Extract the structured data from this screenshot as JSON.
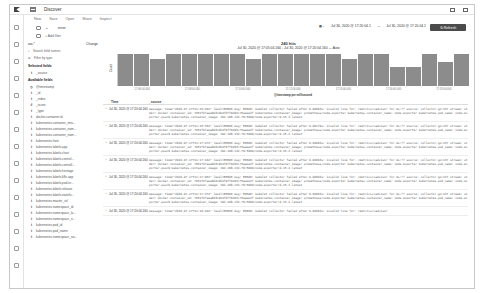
{
  "app": {
    "title": "Discover"
  },
  "nav": {
    "items": [
      "New",
      "Save",
      "Open",
      "Share",
      "Inspect"
    ]
  },
  "query": {
    "value": "error",
    "add_filter": "+ Add filter"
  },
  "date_picker": {
    "show_dates": "Show dates",
    "start": "Jul 30, 2020 @ 17:20:04.1",
    "end": "Jul 30, 2020 @ 17:20:04.1",
    "refresh": "Refresh"
  },
  "sidebar": {
    "index_pattern": "aw-*",
    "index_changed": "Change",
    "search_placeholder": "Search field names",
    "filter_by_type": "Filter by type",
    "selected_fields_head": "Selected fields",
    "selected_fields": [
      "_source"
    ],
    "available_fields_head": "Available fields",
    "available_fields": [
      {
        "type": "◷",
        "name": "@timestamp"
      },
      {
        "type": "t",
        "name": "_id"
      },
      {
        "type": "t",
        "name": "_index"
      },
      {
        "type": "#",
        "name": "_score"
      },
      {
        "type": "t",
        "name": "_type"
      },
      {
        "type": "t",
        "name": "docker.container.id"
      },
      {
        "type": "t",
        "name": "kubernetes.container_ima..."
      },
      {
        "type": "t",
        "name": "kubernetes.container_nam..."
      },
      {
        "type": "t",
        "name": "kubernetes.container_nam..."
      },
      {
        "type": "t",
        "name": "kubernetes.host"
      },
      {
        "type": "t",
        "name": "kubernetes.labels.app"
      },
      {
        "type": "t",
        "name": "kubernetes.labels.chart"
      },
      {
        "type": "t",
        "name": "kubernetes.labels.control..."
      },
      {
        "type": "t",
        "name": "kubernetes.labels.controll..."
      },
      {
        "type": "t",
        "name": "kubernetes.labels.heritage"
      },
      {
        "type": "t",
        "name": "kubernetes.labels.k8s-app"
      },
      {
        "type": "t",
        "name": "kubernetes.labels.pod-te..."
      },
      {
        "type": "t",
        "name": "kubernetes.labels.release"
      },
      {
        "type": "t",
        "name": "kubernetes.labels.statefu..."
      },
      {
        "type": "t",
        "name": "kubernetes.master_url"
      },
      {
        "type": "t",
        "name": "kubernetes.namespace_id"
      },
      {
        "type": "t",
        "name": "kubernetes.namespace_la..."
      },
      {
        "type": "t",
        "name": "kubernetes.namespace_n..."
      },
      {
        "type": "t",
        "name": "kubernetes.pod_id"
      },
      {
        "type": "t",
        "name": "kubernetes.pod_name"
      },
      {
        "type": "t",
        "name": "kubernetes.namespace_na..."
      }
    ]
  },
  "main": {
    "hits_count": "240 hits",
    "range": "Jul 30, 2020 @ 17:05:04.160 - Jul 30, 2020 @ 17:20:04.160 —  Auto",
    "columns": [
      "Time",
      "_source"
    ]
  },
  "chart_data": {
    "type": "bar",
    "title": "240 hits",
    "ylabel": "Count",
    "xlabel": "@timestamp per millisecond",
    "ylim": [
      0,
      12
    ],
    "grid": false,
    "values": [
      12,
      12,
      10,
      12,
      12,
      12,
      12,
      12,
      10,
      12,
      12,
      12,
      12,
      12,
      10,
      12,
      12,
      7,
      7,
      12,
      9,
      12
    ]
  },
  "rows": [
    {
      "time": "Jul 30, 2020 @ 17:20:04.160",
      "source": "message: time=\"2020-07-17T11:15:44Z\" level=ERROR msg: ERROR: kubelet collector failed after 0.00093s: invalid line for: /metrics/cadvisor for ds:?? source: collector.go:137 stream: stderr docker.container_id: 7651fbfaea8d3c0b4f0ff6d93c75aaee2f kubernetes.container_image: prometheus/node-exporter kubernetes.container_name: node-exporter kubernetes.pod_name: node-exporter-pssn9 kubernetes.container_image: 192.168.132.79:5000/node-exporter:0.15.2.latest"
    },
    {
      "time": "Jul 30, 2020 @ 17:20:04.160",
      "source": "message: time=\"2020-07-17T11:15:35Z\" level=ERROR msg: ERROR: kubelet collector failed after 0.00179s: invalid line for: /metrics/cadvisor for ds:?? source: collector.go:137 stream: stderr docker.container_id: 7651fbfaea8d3c0b4f0ff6d93c75aaee2f kubernetes.container_image: prometheus/node-exporter kubernetes.container_name: node-exporter kubernetes.pod_name: node-exporter-pssn9 kubernetes.container_image: 192.168.132.79:5000/node-exporter:0.15.2.latest"
    },
    {
      "time": "Jul 30, 2020 @ 17:20:04.160",
      "source": "message: time=\"2020-07-17T11:17:47Z\" level=ERROR msg: ERROR: kubelet collector failed after 0.00093s: invalid line for: /metrics/cadvisor for ds:?? source: collector.go:137 stream: stderr docker.container_id: 7651fbfaea8d3c0b4f0ff6d93c75aaee2f kubernetes.container_image: prometheus/node-exporter kubernetes.container_name: node-exporter kubernetes.pod_name: node-exporter-pssn9 kubernetes.container_image: 192.168.132.79:5000/node-exporter:0.15.2.latest"
    },
    {
      "time": "Jul 30, 2020 @ 17:20:04.160",
      "source": "message: time=\"2020-07-17T11:17:16Z\" level=ERROR msg: ERROR: kubelet collector failed after 0.00093s: invalid line for: /metrics/cadvisor for ds:?? source: collector.go:137 stream: stderr docker.container_id: 7651fbfaea8d3c0b4f0ff6d93c75aaee2f kubernetes.container_image: prometheus/node-exporter kubernetes.container_name: node-exporter kubernetes.pod_name: node-exporter-pssn9 kubernetes.container_image: 192.168.132.79:5000/node-exporter:0.15.2.latest"
    },
    {
      "time": "Jul 30, 2020 @ 17:20:04.160",
      "source": "message: time=\"2020-07-17T11:17:05Z\" level=ERROR msg: ERROR: kubelet collector failed after 0.00093s: invalid line for: /metrics/cadvisor for ds:?? source: collector.go:137 stream: stderr docker.container_id: 7651fbfaea8d3c0b4f0ff6d93c75aaee2f kubernetes.container_image: prometheus/node-exporter kubernetes.container_name: node-exporter kubernetes.pod_name: node-exporter-pssn9 kubernetes.container_image: 192.168.132.79:5000/node-exporter:0.15.2.latest"
    },
    {
      "time": "Jul 30, 2020 @ 17:20:04.160",
      "source": "message: time=\"2020-07-17T11:17:37Z\" level=ERROR msg: ERROR: kubelet collector failed after 0.00093s: invalid line for: /metrics/cadvisor for ds:?? source: collector.go:137 stream: stderr docker.container_id: 7651fbfaea8d3c0b4f0ff6d93c75aaee2f kubernetes.container_image: prometheus/node-exporter kubernetes.container_name: node-exporter kubernetes.pod_name: node-exporter-pssn9 kubernetes.container_image: 192.168.132.79:5000/node-exporter:0.15.2.latest"
    },
    {
      "time": "Jul 30, 2020 @ 17:20:04.160",
      "source": "message: time=\"2020-07-17T11:16:44Z\" level=ERROR msg: ERROR: kubelet collector failed after 0.00093s: invalid line for: /metrics/cadvisor"
    }
  ]
}
